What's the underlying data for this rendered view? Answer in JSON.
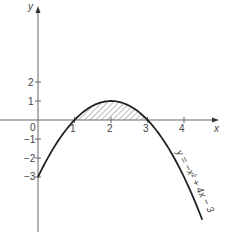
{
  "chart_data": {
    "type": "line",
    "title": "",
    "xlabel": "x",
    "ylabel": "y",
    "equation_label": "y = −x² + 4x − 3",
    "x_ticks": [
      "1",
      "2",
      "3",
      "4"
    ],
    "y_ticks_pos": [
      "1",
      "2"
    ],
    "y_ticks_neg": [
      "−1",
      "−2",
      "−3"
    ],
    "origin_label": "0",
    "xlim": [
      -1,
      4.9
    ],
    "ylim": [
      -6,
      5.9
    ],
    "series": [
      {
        "name": "y = -x^2 + 4x - 3",
        "x": [
          0,
          0.5,
          1,
          1.5,
          2,
          2.5,
          3,
          3.5,
          4,
          4.5
        ],
        "values": [
          -3,
          -1.25,
          0,
          0.75,
          1,
          0.75,
          0,
          -1.25,
          -3,
          -5.25
        ]
      }
    ],
    "shaded_region": {
      "description": "area between curve and x-axis from x=1 to x=3 (hatched)",
      "x_from": 1,
      "x_to": 3
    },
    "grid": false,
    "legend": "none"
  }
}
